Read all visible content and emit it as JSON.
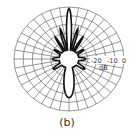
{
  "chart_data": {
    "type": "polar",
    "title": "",
    "caption": "(b)",
    "radial_unit": "dB",
    "radial_ticks": [
      "-20",
      "-10",
      "0"
    ],
    "radial_range": [
      -30,
      0
    ],
    "grid": true,
    "angular_grid_step_deg": 10,
    "series": [
      {
        "name": "radiation pattern",
        "description": "Main lobe toward top (0 dB), back lobe toward bottom (~-3 dB), side lobes at ±15° and ±30°, small lobes at sides",
        "angles_deg": [
          0,
          15,
          30,
          60,
          90,
          120,
          150,
          180,
          210,
          240,
          270,
          300,
          330,
          345
        ],
        "values_db": [
          0,
          -6,
          -12,
          -20,
          -22,
          -20,
          -10,
          -3,
          -10,
          -20,
          -22,
          -20,
          -12,
          -6
        ]
      }
    ]
  },
  "labels": {
    "tick_m20": "-20",
    "tick_m10": "-10",
    "tick_0": "0",
    "unit": "dB",
    "caption": "(b)"
  }
}
